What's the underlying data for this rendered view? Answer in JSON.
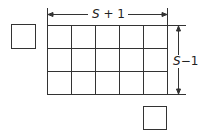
{
  "diagram": {
    "grid": {
      "columns": 5,
      "rows": 3,
      "x": 47,
      "y": 25,
      "width": 120,
      "height": 69
    },
    "width_label": {
      "variable": "S",
      "operator": "+",
      "constant": "1"
    },
    "height_label": {
      "variable": "S",
      "operator": "−",
      "constant": "1"
    },
    "extra_squares": [
      {
        "position": "left",
        "x": 11,
        "y": 24,
        "size": 24
      },
      {
        "position": "bottom-right",
        "x": 143,
        "y": 106,
        "size": 23
      }
    ],
    "colors": {
      "line": "#333333",
      "background": "#ffffff"
    }
  }
}
